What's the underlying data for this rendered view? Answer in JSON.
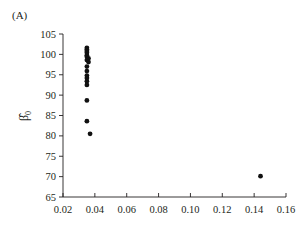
{
  "figure": {
    "panel_label": "(A)"
  },
  "chart_data": {
    "type": "scatter",
    "title": "",
    "panel_label": "(A)",
    "xlabel": "",
    "ylabel": "β̂0",
    "ylabel_main": "β̂",
    "ylabel_sub": "0",
    "xlim": [
      0.02,
      0.16
    ],
    "ylim": [
      65,
      105
    ],
    "x_ticks": [
      0.02,
      0.04,
      0.06,
      0.08,
      0.1,
      0.12,
      0.14,
      0.16
    ],
    "x_tick_labels": [
      "0.02",
      "0.04",
      "0.06",
      "0.08",
      "0.10",
      "0.12",
      "0.14",
      "0.16"
    ],
    "y_ticks": [
      65,
      70,
      75,
      80,
      85,
      90,
      95,
      100,
      105
    ],
    "y_tick_labels": [
      "65",
      "70",
      "75",
      "80",
      "85",
      "90",
      "95",
      "100",
      "105"
    ],
    "grid": false,
    "legend": null,
    "marker_color": "#111111",
    "points": [
      {
        "x": 0.035,
        "y": 101.6
      },
      {
        "x": 0.035,
        "y": 101.2
      },
      {
        "x": 0.035,
        "y": 100.8
      },
      {
        "x": 0.035,
        "y": 100.4
      },
      {
        "x": 0.035,
        "y": 99.8
      },
      {
        "x": 0.035,
        "y": 99.4
      },
      {
        "x": 0.036,
        "y": 99.0
      },
      {
        "x": 0.035,
        "y": 98.6
      },
      {
        "x": 0.036,
        "y": 98.1
      },
      {
        "x": 0.035,
        "y": 97.0
      },
      {
        "x": 0.035,
        "y": 95.9
      },
      {
        "x": 0.035,
        "y": 94.8
      },
      {
        "x": 0.035,
        "y": 94.2
      },
      {
        "x": 0.035,
        "y": 93.4
      },
      {
        "x": 0.035,
        "y": 92.5
      },
      {
        "x": 0.035,
        "y": 88.7
      },
      {
        "x": 0.035,
        "y": 83.6
      },
      {
        "x": 0.037,
        "y": 80.5
      },
      {
        "x": 0.144,
        "y": 70.1
      }
    ]
  }
}
